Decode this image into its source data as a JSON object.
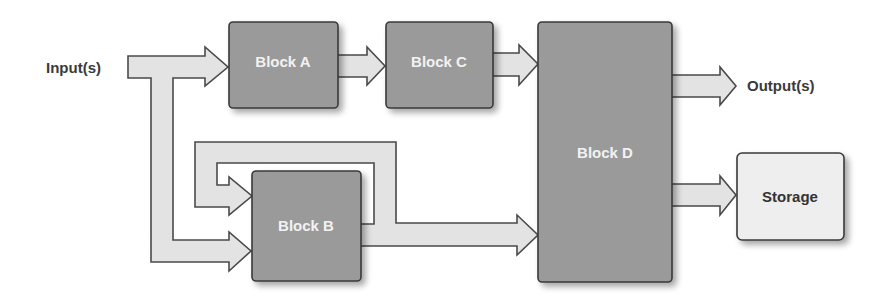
{
  "diagram": {
    "input_label": "Input(s)",
    "output_label": "Output(s)",
    "blocks": [
      {
        "id": "A",
        "label": "Block A"
      },
      {
        "id": "B",
        "label": "Block B"
      },
      {
        "id": "C",
        "label": "Block C"
      },
      {
        "id": "D",
        "label": "Block D"
      },
      {
        "id": "storage",
        "label": "Storage"
      }
    ],
    "connections": [
      {
        "from": "Input(s)",
        "to": "Block A"
      },
      {
        "from": "Input(s)",
        "to": "Block B"
      },
      {
        "from": "Block A",
        "to": "Block C"
      },
      {
        "from": "Block C",
        "to": "Block D"
      },
      {
        "from": "Block B",
        "to": "Block B",
        "type": "feedback"
      },
      {
        "from": "Block B",
        "to": "Block D"
      },
      {
        "from": "Block D",
        "to": "Output(s)"
      },
      {
        "from": "Block D",
        "to": "Storage"
      }
    ],
    "colors": {
      "block_fill": "#9a9a9a",
      "storage_fill": "#eeeeee",
      "arrow_fill": "#e3e3e3",
      "outline": "#3a3a3a"
    }
  }
}
